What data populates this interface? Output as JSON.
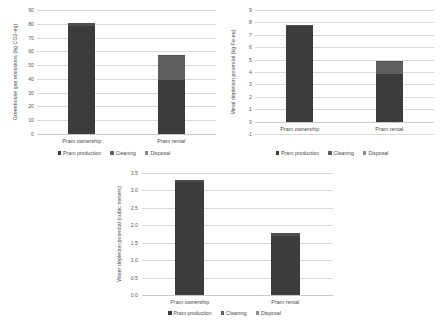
{
  "figure": {
    "background": "#ffffff",
    "series_colors": {
      "production": "#3c3c3c",
      "cleaning": "#5f5f5f",
      "disposal": "#4e4e4e"
    }
  },
  "legend": {
    "production_label": "Pram production",
    "cleaning_label": "Cleaning",
    "disposal_label": "Disposal"
  },
  "chart_data": [
    {
      "id": "ghg",
      "type": "bar",
      "stacked": true,
      "title": "",
      "xlabel": "",
      "ylabel": "Greenhouse gas emissions (kg CO2-eq)",
      "categories": [
        "Pram ownership",
        "Pram rental"
      ],
      "yticks": [
        0,
        10,
        20,
        30,
        40,
        50,
        60,
        70,
        80,
        90
      ],
      "ytick_labels": [
        "0",
        "10",
        "20",
        "30",
        "40",
        "50",
        "60",
        "70",
        "80",
        "90"
      ],
      "ylim": [
        0,
        90
      ],
      "grid": true,
      "legend_position": "bottom",
      "series": [
        {
          "name": "Pram production",
          "values": [
            78.5,
            39.0
          ]
        },
        {
          "name": "Cleaning",
          "values": [
            0.0,
            18.0
          ]
        },
        {
          "name": "Disposal",
          "values": [
            2.0,
            0.6
          ]
        }
      ]
    },
    {
      "id": "metal",
      "type": "bar",
      "stacked": true,
      "title": "",
      "xlabel": "",
      "ylabel": "Metal depletion potential (kg Fe-eq)",
      "categories": [
        "Pram ownership",
        "Pram rental"
      ],
      "yticks": [
        -1,
        0,
        1,
        2,
        3,
        4,
        5,
        6,
        7,
        8,
        9
      ],
      "ytick_labels": [
        "-1",
        "0",
        "1",
        "2",
        "3",
        "4",
        "5",
        "6",
        "7",
        "8",
        "9"
      ],
      "ylim": [
        -1,
        9
      ],
      "grid": true,
      "legend_position": "bottom",
      "series": [
        {
          "name": "Pram production",
          "values": [
            7.7,
            3.85
          ]
        },
        {
          "name": "Cleaning",
          "values": [
            0.0,
            0.95
          ]
        },
        {
          "name": "Disposal",
          "values": [
            0.08,
            0.1
          ]
        }
      ]
    },
    {
      "id": "water",
      "type": "bar",
      "stacked": true,
      "title": "",
      "xlabel": "",
      "ylabel": "Water depletion potential (cubic meters)",
      "categories": [
        "Pram ownership",
        "Pram rental"
      ],
      "yticks": [
        0.0,
        0.5,
        1.0,
        1.5,
        2.0,
        2.5,
        3.0,
        3.5
      ],
      "ytick_labels": [
        "0.0",
        "0.5",
        "1.0",
        "1.5",
        "2.0",
        "2.5",
        "3.0",
        "3.5"
      ],
      "ylim": [
        0.0,
        3.5
      ],
      "grid": true,
      "legend_position": "bottom",
      "series": [
        {
          "name": "Pram production",
          "values": [
            3.25,
            1.7
          ]
        },
        {
          "name": "Cleaning",
          "values": [
            0.0,
            0.0
          ]
        },
        {
          "name": "Disposal",
          "values": [
            0.06,
            0.07
          ]
        }
      ]
    }
  ]
}
